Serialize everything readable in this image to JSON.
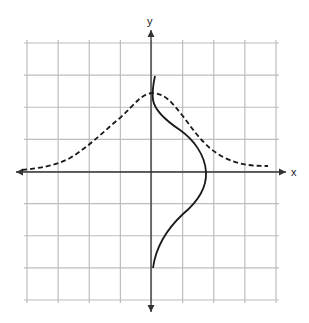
{
  "diagram": {
    "type": "coordinate-plane-graph",
    "axes": {
      "x_label": "x",
      "y_label": "y"
    },
    "grid": {
      "columns": 8,
      "rows": 8,
      "x_range": [
        -4,
        4
      ],
      "y_range": [
        -4,
        4
      ],
      "unit_px": 31.1
    },
    "curves": [
      {
        "name": "dashed-bell-curve",
        "style": "dashed",
        "points": [
          [
            -4.2,
            0.05
          ],
          [
            -3,
            0.3
          ],
          [
            -2,
            1.05
          ],
          [
            -1,
            2.1
          ],
          [
            0,
            2.55
          ],
          [
            1,
            2.1
          ],
          [
            2,
            1.0
          ],
          [
            3,
            0.3
          ],
          [
            3.8,
            0.2
          ]
        ]
      },
      {
        "name": "solid-sideways-curve",
        "style": "solid",
        "points": [
          [
            0.12,
            3.1
          ],
          [
            0.05,
            2.4
          ],
          [
            0.3,
            1.7
          ],
          [
            1.0,
            1.3
          ],
          [
            1.6,
            0.5
          ],
          [
            1.8,
            -0.1
          ],
          [
            1.6,
            -0.9
          ],
          [
            1.0,
            -1.4
          ],
          [
            0.4,
            -2.2
          ],
          [
            0.05,
            -3.0
          ]
        ]
      }
    ]
  },
  "colors": {
    "grid": "#bdbdbd",
    "axis": "#333333",
    "curve": "#1a1a1a"
  }
}
